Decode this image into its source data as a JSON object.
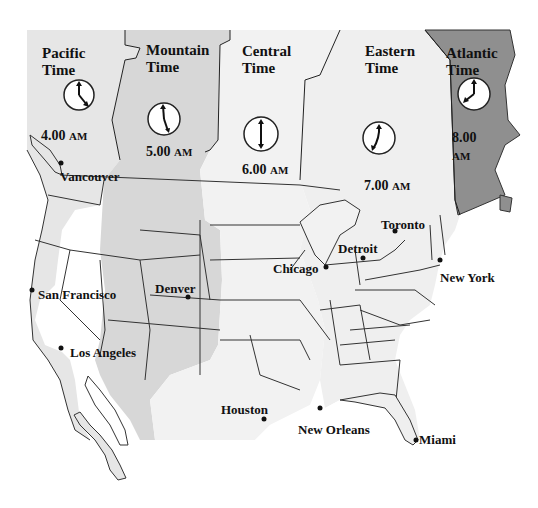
{
  "map": {
    "title": "North American Time Zones",
    "colors": {
      "pacific": "#e6e6e6",
      "mountain": "#d7d7d7",
      "central": "#f2f2f2",
      "eastern": "#efefef",
      "atlantic": "#8f8f8f",
      "border": "#333333",
      "water": "#ffffff"
    },
    "zones": [
      {
        "name": "Pacific",
        "line2": "Time",
        "time": "4.00",
        "ampm": "AM",
        "clock": {
          "hour": 4,
          "minute": 0
        }
      },
      {
        "name": "Mountain",
        "line2": "Time",
        "time": "5.00",
        "ampm": "AM",
        "clock": {
          "hour": 5,
          "minute": 0
        }
      },
      {
        "name": "Central",
        "line2": "Time",
        "time": "6.00",
        "ampm": "AM",
        "clock": {
          "hour": 6,
          "minute": 0
        }
      },
      {
        "name": "Eastern",
        "line2": "Time",
        "time": "7.00",
        "ampm": "AM",
        "clock": {
          "hour": 7,
          "minute": 0
        }
      },
      {
        "name": "Atlantic",
        "line2": "Time",
        "time": "8.00",
        "ampm": "AM",
        "clock": {
          "hour": 8,
          "minute": 0
        }
      }
    ],
    "cities": [
      {
        "name": "Vancouver"
      },
      {
        "name": "San Francisco"
      },
      {
        "name": "Los Angeles"
      },
      {
        "name": "Denver"
      },
      {
        "name": "Chicago"
      },
      {
        "name": "Houston"
      },
      {
        "name": "New Orleans"
      },
      {
        "name": "Detroit"
      },
      {
        "name": "Toronto"
      },
      {
        "name": "New York"
      },
      {
        "name": "Miami"
      }
    ]
  }
}
